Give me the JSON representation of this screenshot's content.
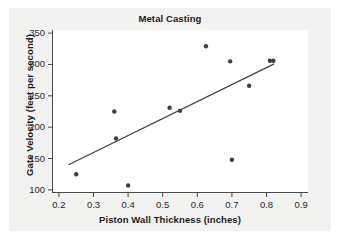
{
  "chart_data": {
    "type": "scatter",
    "title": "Metal Casting",
    "xlabel": "Piston Wall Thickness (inches)",
    "ylabel": "Gate Velocity (feet per second)",
    "xlim": [
      0.18,
      0.92
    ],
    "ylim": [
      95,
      355
    ],
    "xticks": [
      "0.2",
      "0.3",
      "0.4",
      "0.5",
      "0.6",
      "0.7",
      "0.8",
      "0.9"
    ],
    "xtick_values": [
      0.2,
      0.3,
      0.4,
      0.5,
      0.6,
      0.7,
      0.8,
      0.9
    ],
    "yticks": [
      "100",
      "150",
      "200",
      "250",
      "300",
      "350"
    ],
    "ytick_values": [
      100,
      150,
      200,
      250,
      300,
      350
    ],
    "grid": false,
    "legend": false,
    "marker_color": "#404040",
    "line_color": "#404040",
    "axis_color": "#4a4a4a",
    "background_color": "#ffffff",
    "panel_color": "#f2f2f1",
    "points": [
      {
        "x": 0.25,
        "y": 125
      },
      {
        "x": 0.36,
        "y": 225
      },
      {
        "x": 0.365,
        "y": 182
      },
      {
        "x": 0.4,
        "y": 107
      },
      {
        "x": 0.52,
        "y": 231
      },
      {
        "x": 0.55,
        "y": 226
      },
      {
        "x": 0.625,
        "y": 329
      },
      {
        "x": 0.695,
        "y": 305
      },
      {
        "x": 0.7,
        "y": 148
      },
      {
        "x": 0.75,
        "y": 266
      },
      {
        "x": 0.81,
        "y": 306
      },
      {
        "x": 0.82,
        "y": 306
      }
    ],
    "fit_line": {
      "label": "regression-line",
      "x_start": 0.228,
      "y_start": 140,
      "x_end": 0.822,
      "y_end": 301
    }
  }
}
